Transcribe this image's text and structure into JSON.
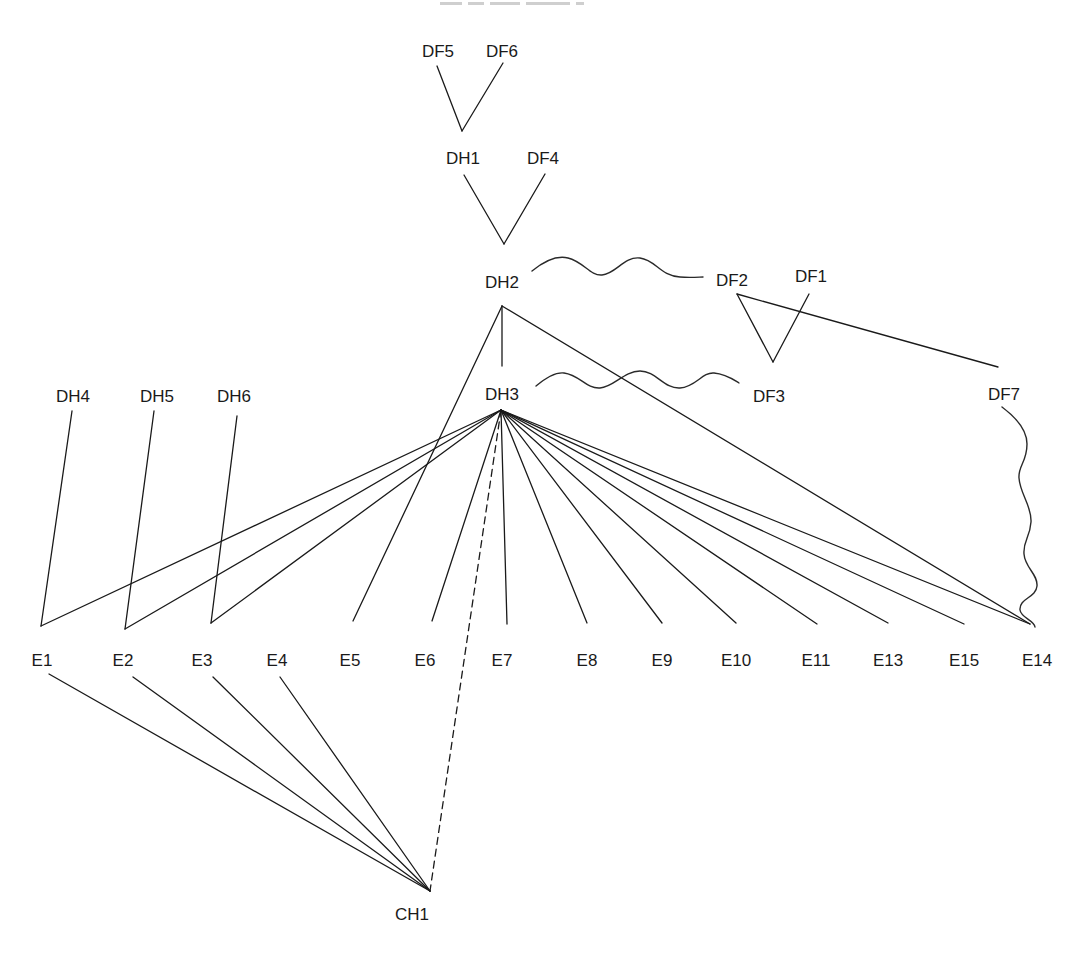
{
  "diagram": {
    "type": "dependency-tree",
    "nodes": [
      {
        "id": "DF5",
        "label": "DF5",
        "x": 438,
        "y": 57
      },
      {
        "id": "DF6",
        "label": "DF6",
        "x": 502,
        "y": 57
      },
      {
        "id": "DH1",
        "label": "DH1",
        "x": 463,
        "y": 164
      },
      {
        "id": "DF4",
        "label": "DF4",
        "x": 543,
        "y": 164
      },
      {
        "id": "DH2",
        "label": "DH2",
        "x": 502,
        "y": 288
      },
      {
        "id": "DF2",
        "label": "DF2",
        "x": 732,
        "y": 286
      },
      {
        "id": "DF1",
        "label": "DF1",
        "x": 811,
        "y": 282
      },
      {
        "id": "DH3",
        "label": "DH3",
        "x": 502,
        "y": 400
      },
      {
        "id": "DF3",
        "label": "DF3",
        "x": 769,
        "y": 402
      },
      {
        "id": "DF7",
        "label": "DF7",
        "x": 1004,
        "y": 400
      },
      {
        "id": "DH4",
        "label": "DH4",
        "x": 73,
        "y": 402
      },
      {
        "id": "DH5",
        "label": "DH5",
        "x": 157,
        "y": 402
      },
      {
        "id": "DH6",
        "label": "DH6",
        "x": 234,
        "y": 402
      },
      {
        "id": "E1",
        "label": "E1",
        "x": 42,
        "y": 666
      },
      {
        "id": "E2",
        "label": "E2",
        "x": 123,
        "y": 666
      },
      {
        "id": "E3",
        "label": "E3",
        "x": 202,
        "y": 666
      },
      {
        "id": "E4",
        "label": "E4",
        "x": 277,
        "y": 666
      },
      {
        "id": "E5",
        "label": "E5",
        "x": 350,
        "y": 666
      },
      {
        "id": "E6",
        "label": "E6",
        "x": 425,
        "y": 666
      },
      {
        "id": "E7",
        "label": "E7",
        "x": 502,
        "y": 666
      },
      {
        "id": "E8",
        "label": "E8",
        "x": 587,
        "y": 666
      },
      {
        "id": "E9",
        "label": "E9",
        "x": 662,
        "y": 666
      },
      {
        "id": "E10",
        "label": "E10",
        "x": 736,
        "y": 666
      },
      {
        "id": "E11",
        "label": "E11",
        "x": 816,
        "y": 666
      },
      {
        "id": "E13",
        "label": "E13",
        "x": 888,
        "y": 666
      },
      {
        "id": "E15",
        "label": "E15",
        "x": 964,
        "y": 666
      },
      {
        "id": "E14",
        "label": "E14",
        "x": 1037,
        "y": 666
      },
      {
        "id": "CH1",
        "label": "CH1",
        "x": 412,
        "y": 920
      }
    ],
    "edges": [
      {
        "from": "DF5",
        "to": "DH1",
        "style": "solid",
        "points": [
          [
            437,
            66
          ],
          [
            462,
            131
          ]
        ]
      },
      {
        "from": "DF6",
        "to": "DH1",
        "style": "solid",
        "points": [
          [
            503,
            63
          ],
          [
            462,
            131
          ]
        ]
      },
      {
        "from": "DH1",
        "to": "DH2",
        "style": "solid",
        "points": [
          [
            464,
            175
          ],
          [
            504,
            244
          ]
        ]
      },
      {
        "from": "DF4",
        "to": "DH2",
        "style": "solid",
        "points": [
          [
            545,
            174
          ],
          [
            504,
            244
          ]
        ]
      },
      {
        "from": "DH2",
        "to": "DH3",
        "style": "solid",
        "points": [
          [
            502,
            306
          ],
          [
            502,
            366
          ]
        ]
      },
      {
        "from": "DH2",
        "to": "E5",
        "style": "solid",
        "points": [
          [
            502,
            306
          ],
          [
            353,
            621
          ]
        ]
      },
      {
        "from": "DH2",
        "to": "E14",
        "style": "solid",
        "points": [
          [
            502,
            306
          ],
          [
            1030,
            624
          ]
        ]
      },
      {
        "from": "DF2",
        "to": "DF3",
        "style": "solid",
        "points": [
          [
            737,
            294
          ],
          [
            773,
            362
          ]
        ]
      },
      {
        "from": "DF1",
        "to": "DF3",
        "style": "solid",
        "points": [
          [
            809,
            294
          ],
          [
            773,
            362
          ]
        ]
      },
      {
        "from": "DF2",
        "to": "DF7",
        "style": "solid",
        "points": [
          [
            737,
            294
          ],
          [
            998,
            367
          ]
        ]
      },
      {
        "from": "DH4",
        "to": "E1",
        "style": "solid",
        "points": [
          [
            72,
            411
          ],
          [
            41,
            626
          ]
        ]
      },
      {
        "from": "DH5",
        "to": "E2",
        "style": "solid",
        "points": [
          [
            154,
            411
          ],
          [
            125,
            629
          ]
        ]
      },
      {
        "from": "DH6",
        "to": "E3",
        "style": "solid",
        "points": [
          [
            237,
            416
          ],
          [
            211,
            623
          ]
        ]
      },
      {
        "from": "DH3",
        "to": "E1",
        "style": "solid",
        "points": [
          [
            501,
            410
          ],
          [
            41,
            626
          ]
        ]
      },
      {
        "from": "DH3",
        "to": "E2",
        "style": "solid",
        "points": [
          [
            501,
            410
          ],
          [
            125,
            629
          ]
        ]
      },
      {
        "from": "DH3",
        "to": "E3",
        "style": "solid",
        "points": [
          [
            501,
            410
          ],
          [
            211,
            623
          ]
        ]
      },
      {
        "from": "DH3",
        "to": "E6",
        "style": "solid",
        "points": [
          [
            501,
            410
          ],
          [
            432,
            621
          ]
        ]
      },
      {
        "from": "DH3",
        "to": "E7",
        "style": "solid",
        "points": [
          [
            501,
            410
          ],
          [
            507,
            624
          ]
        ]
      },
      {
        "from": "DH3",
        "to": "E8",
        "style": "solid",
        "points": [
          [
            501,
            410
          ],
          [
            587,
            623
          ]
        ]
      },
      {
        "from": "DH3",
        "to": "E9",
        "style": "solid",
        "points": [
          [
            501,
            410
          ],
          [
            662,
            623
          ]
        ]
      },
      {
        "from": "DH3",
        "to": "E10",
        "style": "solid",
        "points": [
          [
            501,
            410
          ],
          [
            736,
            623
          ]
        ]
      },
      {
        "from": "DH3",
        "to": "E11",
        "style": "solid",
        "points": [
          [
            501,
            410
          ],
          [
            817,
            624
          ]
        ]
      },
      {
        "from": "DH3",
        "to": "E13",
        "style": "solid",
        "points": [
          [
            501,
            410
          ],
          [
            888,
            623
          ]
        ]
      },
      {
        "from": "DH3",
        "to": "E15",
        "style": "solid",
        "points": [
          [
            501,
            410
          ],
          [
            964,
            624
          ]
        ]
      },
      {
        "from": "DH3",
        "to": "E14",
        "style": "solid",
        "points": [
          [
            501,
            410
          ],
          [
            1030,
            624
          ]
        ]
      },
      {
        "from": "DH3",
        "to": "CH1",
        "style": "dashed",
        "points": [
          [
            501,
            410
          ],
          [
            430,
            891
          ]
        ]
      },
      {
        "from": "E1",
        "to": "CH1",
        "style": "solid",
        "points": [
          [
            49,
            674
          ],
          [
            430,
            891
          ]
        ]
      },
      {
        "from": "E2",
        "to": "CH1",
        "style": "solid",
        "points": [
          [
            133,
            677
          ],
          [
            430,
            891
          ]
        ]
      },
      {
        "from": "E3",
        "to": "CH1",
        "style": "solid",
        "points": [
          [
            213,
            677
          ],
          [
            430,
            891
          ]
        ]
      },
      {
        "from": "E4",
        "to": "CH1",
        "style": "solid",
        "points": [
          [
            280,
            677
          ],
          [
            430,
            891
          ]
        ]
      }
    ],
    "wavy_links": [
      {
        "from": "DH2",
        "to": "DF2",
        "path": "M532,271 C548,258 560,256 568,258 C584,262 590,276 602,275 C616,274 624,256 640,258 C656,260 660,276 680,277 C690,278 700,277 703,277"
      },
      {
        "from": "DH3",
        "to": "DF3",
        "path": "M536,386 C548,376 556,372 564,373 C580,375 586,389 600,388 C614,387 624,371 640,371 C656,371 664,389 680,388 C696,387 702,372 714,373 C726,374 734,380 739,383"
      },
      {
        "from": "DF7",
        "to": "E14",
        "path": "M1002,407 C1014,416 1027,428 1027,444 C1027,462 1018,466 1019,478 C1020,494 1032,506 1031,522 C1030,538 1023,540 1024,554 C1025,568 1038,574 1037,586 C1036,598 1019,598 1020,610 C1021,618 1034,620 1035,627"
      }
    ]
  }
}
